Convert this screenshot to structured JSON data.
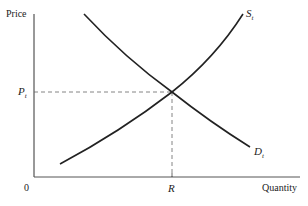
{
  "diagram": {
    "type": "supply-demand",
    "axes": {
      "y_label": "Price",
      "x_label": "Quantity",
      "origin_label": "0"
    },
    "curves": [
      {
        "name": "supply",
        "label_main": "S",
        "label_sub": "t"
      },
      {
        "name": "demand",
        "label_main": "D",
        "label_sub": "t"
      }
    ],
    "equilibrium": {
      "price_label_main": "P",
      "price_label_sub": "t",
      "quantity_label": "R"
    },
    "colors": {
      "line": "#222222",
      "dashed": "#555555",
      "background": "#ffffff"
    }
  }
}
